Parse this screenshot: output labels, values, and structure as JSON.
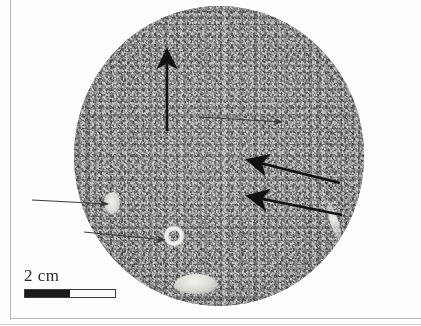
{
  "figure": {
    "kind": "ct-scan-slice",
    "caption_text": "",
    "background_color": "#fdfdfd"
  },
  "ct_slice": {
    "shape": "circle",
    "matrix_color": "#8a8a8a",
    "dark_speckle_color": "#575757",
    "light_speckle_color": "#c2c2c2",
    "center_x_px": 219,
    "center_y_px": 156,
    "diameter_px": 290,
    "description": "Grainy gray computed-tomography cross-section of a cylindrical core"
  },
  "features": [
    {
      "name": "white-hook-fracture",
      "label": "",
      "color": "#f4f4f1"
    },
    {
      "name": "bright-inclusion-bottom",
      "label": "",
      "color": "#f6f6f4"
    },
    {
      "name": "bright-inclusion-left-edge",
      "label": "",
      "color": "#f0f0ee"
    },
    {
      "name": "bright-ring-inclusion",
      "label": "",
      "color": "#ededea"
    },
    {
      "name": "bright-rim-streak",
      "label": "",
      "color": "#efefec"
    }
  ],
  "annotations": {
    "arrow_color_thick": "#121212",
    "arrow_color_thin": "#3a3a3a",
    "arrows": [
      {
        "name": "arrow-up-vertical",
        "style": "thick",
        "tail_x": 167,
        "tail_y": 131,
        "head_x": 167,
        "head_y": 44
      },
      {
        "name": "arrow-thin-upper-right",
        "style": "thin",
        "tail_x": 199,
        "tail_y": 117,
        "head_x": 287,
        "head_y": 122
      },
      {
        "name": "arrow-thick-upper-left",
        "style": "thick",
        "tail_x": 340,
        "tail_y": 183,
        "head_x": 241,
        "head_y": 158
      },
      {
        "name": "arrow-thick-lower-left",
        "style": "thick",
        "tail_x": 342,
        "tail_y": 215,
        "head_x": 241,
        "head_y": 194
      },
      {
        "name": "arrow-thin-left-horizontal",
        "style": "thin",
        "tail_x": 32,
        "tail_y": 200,
        "head_x": 113,
        "head_y": 204
      },
      {
        "name": "arrow-thin-lower-diagonal",
        "style": "thin",
        "tail_x": 84,
        "tail_y": 232,
        "head_x": 170,
        "head_y": 240
      }
    ]
  },
  "scale_bar": {
    "label": "2 cm",
    "total_width_px": 92,
    "segments": 2,
    "dark_color": "#1c1c1c",
    "light_color": "#fbfbfb",
    "border_color": "#3c3c3c"
  },
  "frame": {
    "line_color": "#b9b9bd"
  }
}
